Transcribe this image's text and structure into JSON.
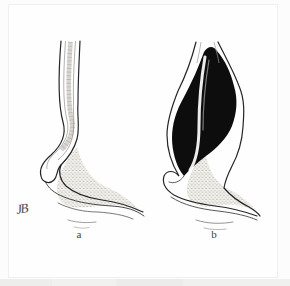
{
  "illustration": {
    "alt": "Two-panel line drawing of the gastroesophageal junction: panel a shows a narrow-caliber esophagus curving into the stomach; panel b shows a dilated, black-filled esophagus tapering to a narrow beak at the cardia",
    "panels": [
      {
        "label": "a"
      },
      {
        "label": "b"
      }
    ],
    "monogram": "JB",
    "colors": {
      "background": "#fcfcfc",
      "frame_line": "#f1efef",
      "bottom_band": "#efefef",
      "ink": "#262626",
      "lumen_black": "#0d0d0d",
      "stipple_dot": "#8e8a80",
      "stipple_bg": "#f3f1ed"
    }
  }
}
